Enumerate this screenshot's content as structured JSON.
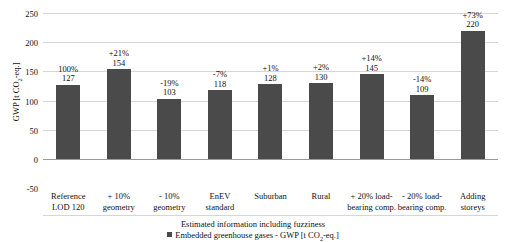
{
  "top_partial_title": "",
  "axes": {
    "ylabel_prefix": "GWP [t CO",
    "ylabel_sub": "2",
    "ylabel_suffix": "-eq.]",
    "yticks": [
      "250",
      "200",
      "150",
      "100",
      "50",
      "0",
      "-50"
    ]
  },
  "legend": {
    "line1": "Estimated information including fuzziness",
    "series_prefix": "Embedded greenhouse gases - GWP [t CO",
    "series_sub": "2",
    "series_suffix": "-eq.]",
    "swatch_color": "#4a4a4a"
  },
  "chart_data": {
    "type": "bar",
    "title": "",
    "xlabel": "",
    "ylabel": "GWP [t CO2-eq.]",
    "ylim": [
      -50,
      250
    ],
    "yticks": [
      250,
      200,
      150,
      100,
      50,
      0,
      -50
    ],
    "grid": true,
    "legend_position": "bottom",
    "bar_color": "#4a4a4a",
    "series_name": "Embedded greenhouse gases - GWP [t CO2-eq.]",
    "categories": [
      "Reference\nLOD 120",
      "+ 10%\ngeometry",
      "- 10%\ngeometry",
      "EnEV\nstandard",
      "Suburban",
      "Rural",
      "+ 20% load-\nbearing comp.",
      "- 20% load-\nbearing comp.",
      "Adding\nstoreys"
    ],
    "values": [
      127,
      154,
      103,
      118,
      128,
      130,
      145,
      109,
      220
    ],
    "percent_labels": [
      "100%",
      "+21%",
      "-19%",
      "-7%",
      "+1%",
      "+2%",
      "+14%",
      "-14%",
      "+73%"
    ]
  },
  "categories_display": [
    {
      "line1": "Reference",
      "line2": "LOD 120"
    },
    {
      "line1": "+ 10%",
      "line2": "geometry"
    },
    {
      "line1": "- 10%",
      "line2": "geometry"
    },
    {
      "line1": "EnEV",
      "line2": "standard"
    },
    {
      "line1": "Suburban",
      "line2": ""
    },
    {
      "line1": "Rural",
      "line2": ""
    },
    {
      "line1": "+ 20% load-",
      "line2": "bearing comp."
    },
    {
      "line1": "- 20% load-",
      "line2": "bearing comp."
    },
    {
      "line1": "Adding",
      "line2": "storeys"
    }
  ]
}
